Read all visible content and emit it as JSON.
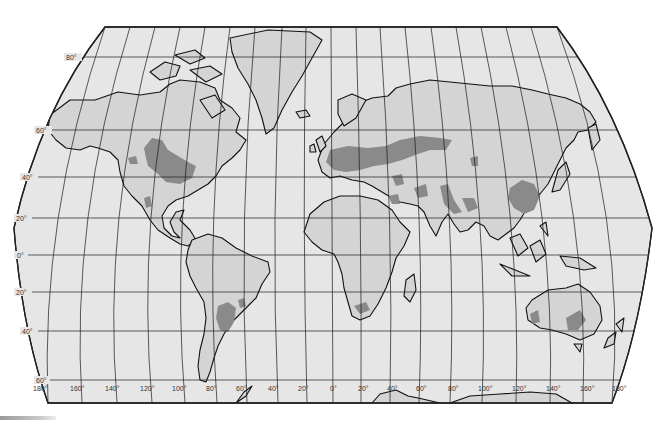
{
  "map": {
    "projection": "world-pseudocylindrical",
    "colors": {
      "ocean": "#e6e6e6",
      "land": "#d4d4d4",
      "highlight_region": "#8a8a8a",
      "graticule": "#1a1a1a",
      "coastline": "#111111",
      "frame": "#222222"
    },
    "latitude_labels": [
      {
        "text": "80°",
        "x": 74,
        "y": 59
      },
      {
        "text": "60°",
        "x": 42,
        "y": 132
      },
      {
        "text": "40°",
        "x": 27,
        "y": 180
      },
      {
        "text": "20°",
        "x": 18,
        "y": 220
      },
      {
        "text": "0°",
        "x": 18,
        "y": 257
      },
      {
        "text": "20°",
        "x": 18,
        "y": 294
      },
      {
        "text": "40°",
        "x": 24,
        "y": 333
      },
      {
        "text": "60°",
        "x": 40,
        "y": 382
      }
    ],
    "longitude_labels": [
      {
        "text": "180°",
        "x": 33,
        "y": 390
      },
      {
        "text": "160°",
        "x": 70,
        "y": 390
      },
      {
        "text": "140°",
        "x": 105,
        "y": 390
      },
      {
        "text": "120°",
        "x": 140,
        "y": 390
      },
      {
        "text": "100°",
        "x": 172,
        "y": 390
      },
      {
        "text": "80°",
        "x": 206,
        "y": 390
      },
      {
        "text": "60°",
        "x": 236,
        "y": 390
      },
      {
        "text": "40°",
        "x": 268,
        "y": 390
      },
      {
        "text": "20°",
        "x": 298,
        "y": 390
      },
      {
        "text": "0°",
        "x": 330,
        "y": 390
      },
      {
        "text": "20°",
        "x": 358,
        "y": 390
      },
      {
        "text": "40°",
        "x": 387,
        "y": 390
      },
      {
        "text": "60°",
        "x": 416,
        "y": 390
      },
      {
        "text": "80°",
        "x": 448,
        "y": 390
      },
      {
        "text": "100°",
        "x": 478,
        "y": 390
      },
      {
        "text": "120°",
        "x": 512,
        "y": 390
      },
      {
        "text": "140°",
        "x": 546,
        "y": 390
      },
      {
        "text": "160°",
        "x": 580,
        "y": 390
      },
      {
        "text": "180°",
        "x": 612,
        "y": 390
      }
    ],
    "highlighted_regions": [
      "north-american-great-plains",
      "central-valley-california",
      "mexican-plateau",
      "pampas",
      "european-plain",
      "eurasian-steppe",
      "middle-east-fertile-crescent",
      "indus-ganges",
      "north-china-plain",
      "south-africa-highveld",
      "southwest-australia",
      "southeast-australia"
    ]
  }
}
